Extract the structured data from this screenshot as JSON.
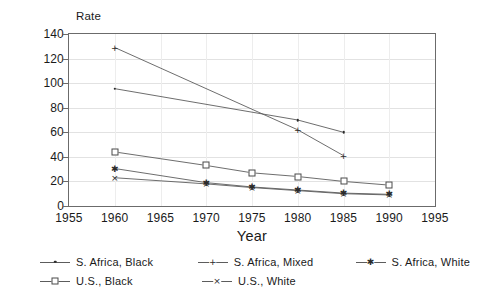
{
  "chart_data": {
    "type": "line",
    "title": "",
    "xlabel": "Year",
    "ylabel": "Rate",
    "xlim": [
      1955,
      1995
    ],
    "ylim": [
      0,
      140
    ],
    "xticks": [
      1955,
      1960,
      1965,
      1970,
      1975,
      1980,
      1985,
      1990,
      1995
    ],
    "yticks": [
      0,
      20,
      40,
      60,
      80,
      100,
      120,
      140
    ],
    "grid": true,
    "legend_position": "bottom",
    "series": [
      {
        "name": "S. Africa, Black",
        "marker": "dot",
        "x": [
          1960,
          1980,
          1985
        ],
        "values": [
          95.5,
          70,
          60
        ]
      },
      {
        "name": "S. Africa, Mixed",
        "marker": "plus",
        "x": [
          1960,
          1980,
          1985
        ],
        "values": [
          129,
          62,
          41
        ]
      },
      {
        "name": "S. Africa, White",
        "marker": "asterisk",
        "x": [
          1960,
          1970,
          1975,
          1980,
          1985,
          1990
        ],
        "values": [
          30.5,
          19,
          15.5,
          13,
          10.5,
          9.5
        ]
      },
      {
        "name": "U.S., Black",
        "marker": "square",
        "x": [
          1960,
          1970,
          1975,
          1980,
          1985,
          1990
        ],
        "values": [
          44,
          33,
          27,
          24,
          20,
          17
        ]
      },
      {
        "name": "U.S., White",
        "marker": "x",
        "x": [
          1960,
          1970,
          1975,
          1980,
          1985,
          1990
        ],
        "values": [
          23,
          18,
          15,
          12.5,
          10,
          9
        ]
      }
    ]
  },
  "axis": {
    "y_title": "Rate",
    "x_title": "Year",
    "ytick_labels": [
      "0",
      "20",
      "40",
      "60",
      "80",
      "100",
      "120",
      "140"
    ],
    "xtick_labels": [
      "1955",
      "1960",
      "1965",
      "1970",
      "1975",
      "1980",
      "1985",
      "1990",
      "1995"
    ]
  },
  "legend": {
    "items": [
      {
        "label": "S. Africa, Black",
        "marker": "dot-marker"
      },
      {
        "label": "S. Africa, Mixed",
        "marker": "plus-marker"
      },
      {
        "label": "S. Africa, White",
        "marker": "asterisk-marker"
      },
      {
        "label": "U.S., Black",
        "marker": "square-marker"
      },
      {
        "label": "U.S., White",
        "marker": "x-marker"
      }
    ]
  },
  "colors": {
    "line": "#5c5c5c",
    "frame": "#6b6b6b",
    "grid": "#e2e2e2",
    "text": "#1a1a1a",
    "background": "#ffffff"
  }
}
